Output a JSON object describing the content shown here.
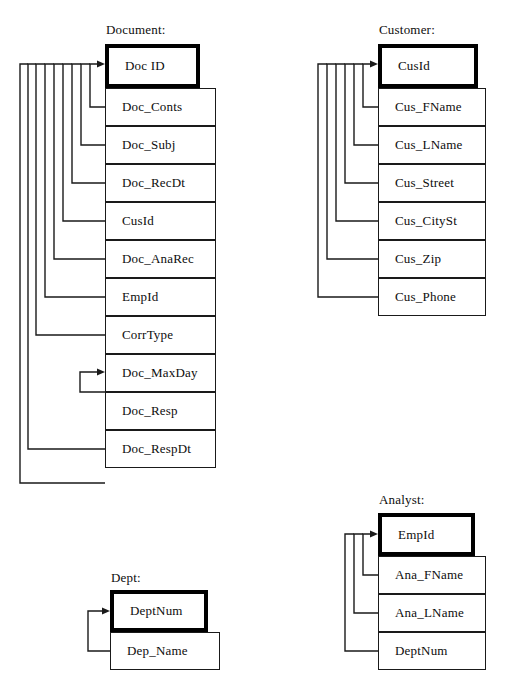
{
  "diagram": {
    "type": "relational-schema-diagram",
    "title_suffix": ":",
    "entities": [
      {
        "id": "document",
        "title": "Document:",
        "title_pos": {
          "x": 106,
          "y": 22
        },
        "pk_box": {
          "x": 105,
          "y": 44,
          "w": 95,
          "h": 44
        },
        "attr_box": {
          "x": 105,
          "y": 88,
          "w": 111,
          "h": 38
        },
        "primary_key": "Doc ID",
        "attributes": [
          "Doc_Conts",
          "Doc_Subj",
          "Doc_RecDt",
          "CusId",
          "Doc_AnaRec",
          "EmpId",
          "CorrType",
          "Doc_MaxDay",
          "Doc_Resp",
          "Doc_RespDt"
        ]
      },
      {
        "id": "customer",
        "title": "Customer:",
        "title_pos": {
          "x": 379,
          "y": 22
        },
        "pk_box": {
          "x": 378,
          "y": 44,
          "w": 100,
          "h": 44
        },
        "attr_box": {
          "x": 378,
          "y": 88,
          "w": 108,
          "h": 38
        },
        "primary_key": "CusId",
        "attributes": [
          "Cus_FName",
          "Cus_LName",
          "Cus_Street",
          "Cus_CitySt",
          "Cus_Zip",
          "Cus_Phone"
        ]
      },
      {
        "id": "analyst",
        "title": "Analyst:",
        "title_pos": {
          "x": 379,
          "y": 492
        },
        "pk_box": {
          "x": 378,
          "y": 513,
          "w": 97,
          "h": 43
        },
        "attr_box": {
          "x": 378,
          "y": 556,
          "w": 108,
          "h": 38
        },
        "primary_key": "EmpId",
        "attributes": [
          "Ana_FName",
          "Ana_LName",
          "DeptNum"
        ]
      },
      {
        "id": "dept",
        "title": "Dept:",
        "title_pos": {
          "x": 111,
          "y": 570
        },
        "pk_box": {
          "x": 110,
          "y": 590,
          "w": 98,
          "h": 42
        },
        "attr_box": {
          "x": 110,
          "y": 632,
          "w": 110,
          "h": 38
        },
        "primary_key": "DeptNum",
        "attributes": [
          "Dep_Name"
        ]
      }
    ],
    "relationships": [
      {
        "from": "Document.Doc_Conts",
        "to": "Document.Doc ID"
      },
      {
        "from": "Document.Doc_Subj",
        "to": "Document.Doc ID"
      },
      {
        "from": "Document.Doc_RecDt",
        "to": "Document.Doc ID"
      },
      {
        "from": "Document.CusId",
        "to": "Document.Doc ID"
      },
      {
        "from": "Document.Doc_AnaRec",
        "to": "Document.Doc ID"
      },
      {
        "from": "Document.EmpId",
        "to": "Document.Doc ID"
      },
      {
        "from": "Document.CorrType",
        "to": "Document.Doc ID"
      },
      {
        "from": "Document.Doc_MaxDay",
        "to": "Document.CorrType"
      },
      {
        "from": "Document.Doc_Resp",
        "to": "Document.Doc ID"
      },
      {
        "from": "Document.Doc_RespDt",
        "to": "Document.Doc ID"
      },
      {
        "from": "Customer.Cus_FName",
        "to": "Customer.CusId"
      },
      {
        "from": "Customer.Cus_LName",
        "to": "Customer.CusId"
      },
      {
        "from": "Customer.Cus_Street",
        "to": "Customer.CusId"
      },
      {
        "from": "Customer.Cus_CitySt",
        "to": "Customer.CusId"
      },
      {
        "from": "Customer.Cus_Zip",
        "to": "Customer.CusId"
      },
      {
        "from": "Customer.Cus_Phone",
        "to": "Customer.CusId"
      },
      {
        "from": "Analyst.Ana_FName",
        "to": "Analyst.EmpId"
      },
      {
        "from": "Analyst.Ana_LName",
        "to": "Analyst.EmpId"
      },
      {
        "from": "Analyst.DeptNum",
        "to": "Analyst.EmpId"
      },
      {
        "from": "Dept.Dep_Name",
        "to": "Dept.DeptNum"
      }
    ],
    "colors": {
      "stroke": "#1a1a1a",
      "pk_border": "#000000",
      "background": "#ffffff",
      "text": "#0d0d0d"
    }
  }
}
